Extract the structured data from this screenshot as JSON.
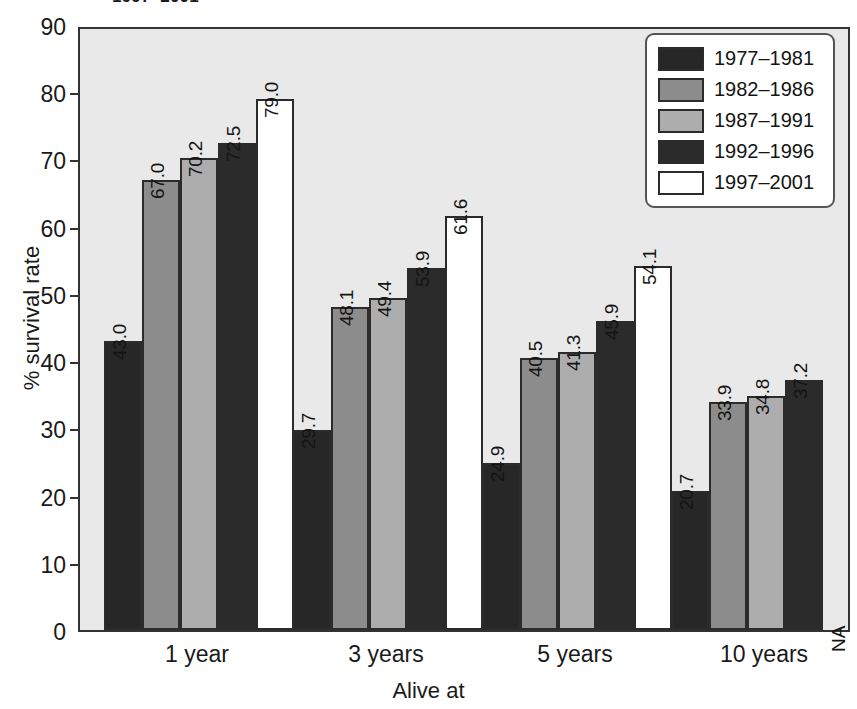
{
  "title": "1997–2001",
  "chart_data": {
    "type": "bar",
    "title": "1997–2001",
    "xlabel": "Alive at",
    "ylabel": "% survival rate",
    "ylim": [
      0,
      90
    ],
    "yticks": [
      0,
      10,
      20,
      30,
      40,
      50,
      60,
      70,
      80,
      90
    ],
    "grid": false,
    "legend_position": "top-right",
    "categories": [
      "1 year",
      "3 years",
      "5 years",
      "10 years"
    ],
    "series": [
      {
        "name": "1977–1981",
        "color": "#272727",
        "values": [
          43.0,
          29.7,
          24.9,
          20.7
        ],
        "labels": [
          "43.0",
          "29.7",
          "24.9",
          "20.7"
        ]
      },
      {
        "name": "1982–1986",
        "color": "#8c8c8c",
        "values": [
          67.0,
          48.1,
          40.5,
          33.9
        ],
        "labels": [
          "67.0",
          "48.1",
          "40.5",
          "33.9"
        ]
      },
      {
        "name": "1987–1991",
        "color": "#adadad",
        "values": [
          70.2,
          49.4,
          41.3,
          34.8
        ],
        "labels": [
          "70.2",
          "49.4",
          "41.3",
          "34.8"
        ]
      },
      {
        "name": "1992–1996",
        "color": "#2b2b2b",
        "values": [
          72.5,
          53.9,
          45.9,
          37.2
        ],
        "labels": [
          "72.5",
          "53.9",
          "45.9",
          "37.2"
        ]
      },
      {
        "name": "1997–2001",
        "color": "#ffffff",
        "values": [
          79.0,
          61.6,
          54.1,
          null
        ],
        "labels": [
          "79.0",
          "61.6",
          "54.1",
          "NA"
        ]
      }
    ]
  },
  "yaxis": {
    "title": "% survival rate",
    "ticks": [
      "90",
      "80",
      "70",
      "60",
      "50",
      "40",
      "30",
      "20",
      "10",
      "0"
    ]
  },
  "xaxis": {
    "title": "Alive at",
    "categories": [
      "1 year",
      "3 years",
      "5 years",
      "10 years"
    ]
  },
  "legend": {
    "items": [
      {
        "label": "1977–1981",
        "color": "#272727"
      },
      {
        "label": "1982–1986",
        "color": "#8c8c8c"
      },
      {
        "label": "1987–1991",
        "color": "#adadad"
      },
      {
        "label": "1992–1996",
        "color": "#2b2b2b"
      },
      {
        "label": "1997–2001",
        "color": "#ffffff"
      }
    ]
  },
  "style": {
    "plot_background": "#e9e9e9",
    "axis_color": "#333333",
    "page_background": "#ffffff"
  }
}
